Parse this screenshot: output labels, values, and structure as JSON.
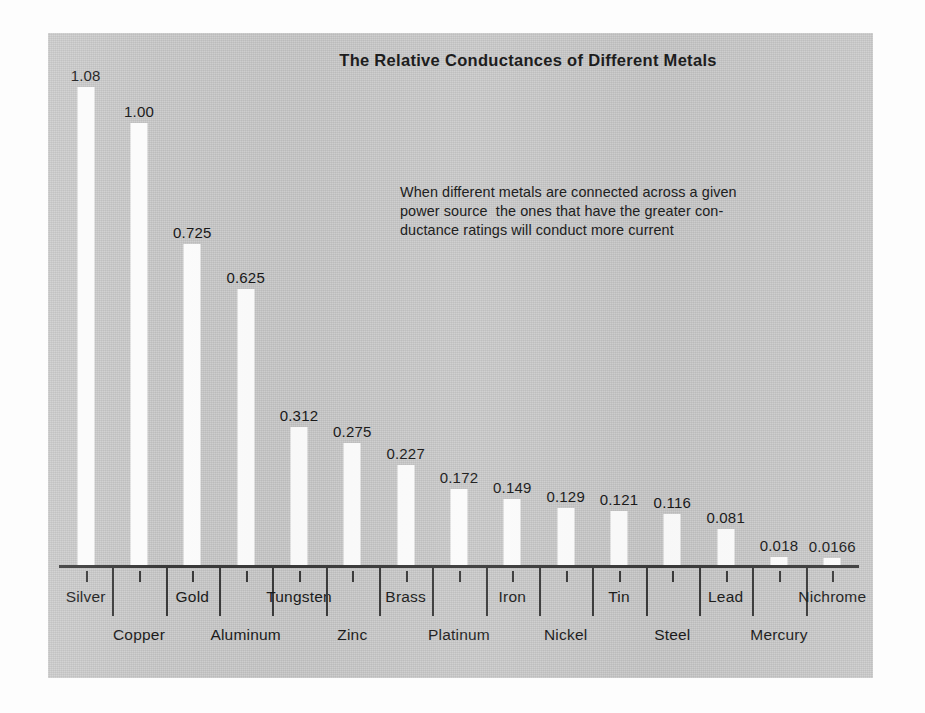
{
  "chart_data": {
    "type": "bar",
    "title": "The Relative Conductances of Different Metals",
    "xlabel": "",
    "ylabel": "",
    "ylim": [
      0,
      1.18
    ],
    "grid": false,
    "legend": "none",
    "annotations": [
      "When different metals are connected across a given",
      "power source  the ones that have the greater con-",
      "ductance ratings will conduct more current"
    ],
    "categories": [
      "Silver",
      "Copper",
      "Gold",
      "Aluminum",
      "Tungsten",
      "Zinc",
      "Brass",
      "Platinum",
      "Iron",
      "Nickel",
      "Tin",
      "Steel",
      "Lead",
      "Mercury",
      "Nichrome"
    ],
    "values": [
      1.08,
      1.0,
      0.725,
      0.625,
      0.312,
      0.275,
      0.227,
      0.172,
      0.149,
      0.129,
      0.121,
      0.116,
      0.081,
      0.018,
      0.0166
    ],
    "value_labels": [
      "1.08",
      "1.00",
      "0.725",
      "0.625",
      "0.312",
      "0.275",
      "0.227",
      "0.172",
      "0.149",
      "0.129",
      "0.121",
      "0.116",
      "0.081",
      "0.018",
      "0.0166"
    ],
    "label_rows": [
      "top",
      "bottom",
      "top",
      "bottom",
      "top",
      "bottom",
      "top",
      "bottom",
      "top",
      "bottom",
      "top",
      "bottom",
      "top",
      "bottom",
      "top"
    ],
    "colors": {
      "panel_background": "#c9c9c9",
      "bar_fill": "#fbfbfb",
      "axis": "#3a3a3a",
      "text": "#1a1a1a",
      "page_background": "#fdfdfd"
    }
  }
}
